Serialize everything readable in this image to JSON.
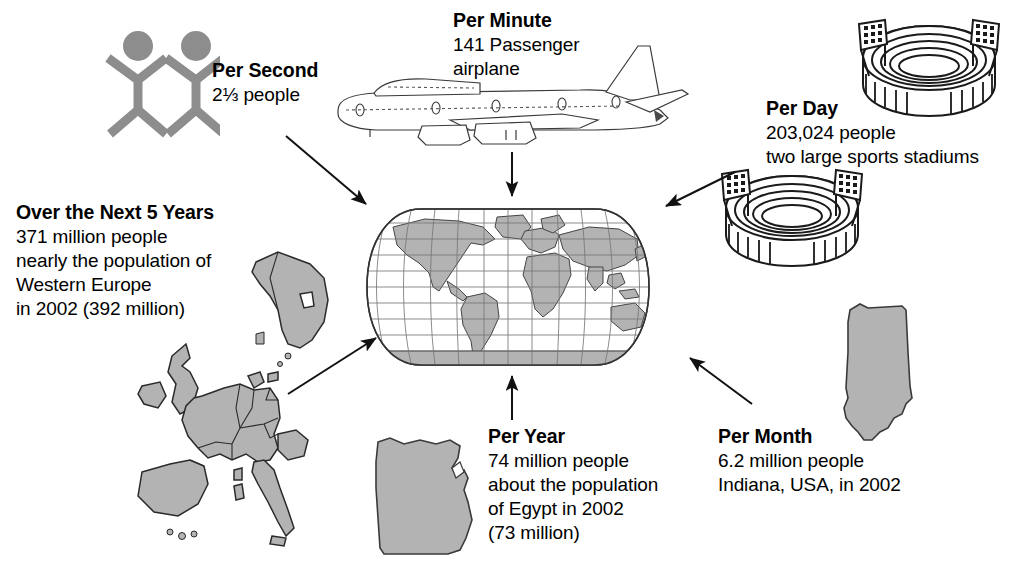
{
  "infographic": {
    "theme_colors": {
      "land_gray": "#b3b3b3",
      "people_gray": "#8d8d8d",
      "outline_black": "#1a1a1a",
      "background": "#ffffff"
    },
    "blocks": [
      {
        "id": "per-second",
        "title": "Per Second",
        "lines": [
          "2⅓ people"
        ],
        "icon": "stick-people-icon"
      },
      {
        "id": "per-minute",
        "title": "Per Minute",
        "lines": [
          "141 Passenger",
          "airplane"
        ],
        "icon": "airplane-icon"
      },
      {
        "id": "per-day",
        "title": "Per Day",
        "lines": [
          "203,024 people",
          "two large sports stadiums"
        ],
        "icon": "stadium-icon"
      },
      {
        "id": "over-next-5-years",
        "title": "Over the Next 5 Years",
        "lines": [
          "371 million people",
          "nearly the population of",
          "Western Europe",
          "in 2002 (392 million)"
        ],
        "icon": "western-europe-map-icon"
      },
      {
        "id": "per-year",
        "title": "Per Year",
        "lines": [
          "74 million people",
          "about the population",
          "of Egypt in 2002",
          "(73 million)"
        ],
        "icon": "egypt-map-icon"
      },
      {
        "id": "per-month",
        "title": "Per Month",
        "lines": [
          "6.2 million people",
          "Indiana, USA, in 2002"
        ],
        "icon": "indiana-map-icon"
      }
    ],
    "center": {
      "icon": "world-map-globe-icon",
      "description": "world map"
    }
  }
}
